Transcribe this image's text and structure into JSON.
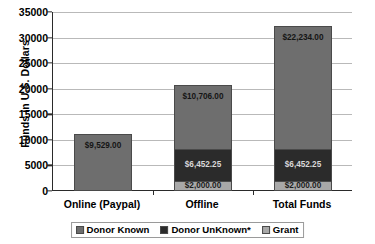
{
  "chart_data": {
    "type": "bar",
    "subtype": "stacked-column",
    "title": "",
    "xlabel": "",
    "ylabel": "Funds in U.S. Dollars",
    "categories": [
      "Online (Paypal)",
      "Offline",
      "Total Funds"
    ],
    "ylim": [
      0,
      35000
    ],
    "ytick_values": [
      0,
      5000,
      10000,
      15000,
      20000,
      25000,
      30000,
      35000
    ],
    "ytick_labels": [
      "0",
      "5000",
      "10000",
      "15000",
      "20000",
      "25000",
      "30000",
      "35000"
    ],
    "grid": true,
    "grid_axis": "y",
    "legend_position": "bottom-center",
    "series": [
      {
        "name": "Grant",
        "color": "#a8a8a8",
        "values": [
          0,
          2000,
          2000
        ],
        "labels": [
          "",
          "$2,000.00",
          "$2,000.00"
        ]
      },
      {
        "name": "Donor UnKnown*",
        "color": "#2b2b2b",
        "values": [
          0,
          6452.25,
          6452.25
        ],
        "labels": [
          "",
          "$6,452.25",
          "$6,452.25"
        ]
      },
      {
        "name": "Donor Known",
        "color": "#6e6e6e",
        "values": [
          11200,
          12600,
          24200
        ],
        "labels": [
          "$9,529.00",
          "$10,706.00",
          "$22,234.00"
        ]
      }
    ],
    "annotations": [
      "$9,529.00",
      "$2,000.00",
      "$6,452.25",
      "$10,706.00",
      "$2,000.00",
      "$6,452.25",
      "$22,234.00"
    ],
    "colors": {
      "donor_known": "#6e6e6e",
      "donor_unknown": "#2b2b2b",
      "grant": "#a8a8a8",
      "gridline": "#b9b9b9",
      "axis": "#2a2a2a",
      "background": "#ffffff"
    }
  },
  "legend": {
    "items": [
      {
        "label": "Donor Known",
        "color": "#6e6e6e"
      },
      {
        "label": "Donor UnKnown*",
        "color": "#2b2b2b"
      },
      {
        "label": "Grant",
        "color": "#a8a8a8"
      }
    ]
  }
}
